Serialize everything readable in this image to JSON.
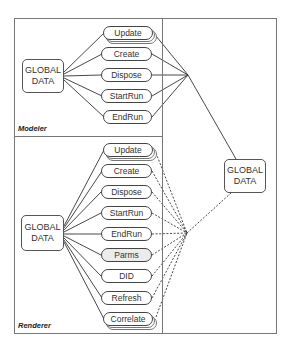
{
  "diagram": {
    "modeler": {
      "label": "Modeler",
      "global_box": "GLOBAL\nDATA",
      "methods": [
        "Update",
        "Create",
        "Dispose",
        "StartRun",
        "EndRun"
      ]
    },
    "renderer": {
      "label": "Renderer",
      "global_box": "GLOBAL\nDATA",
      "methods": [
        "Update",
        "Create",
        "Dispose",
        "StartRun",
        "EndRun",
        "Parms",
        "DID",
        "Refresh",
        "Correlate"
      ]
    },
    "shared": {
      "global_box": "GLOBAL\nDATA"
    },
    "colors": {
      "line": "#333333",
      "frame": "#777777",
      "parms_fill": "#ececec"
    }
  }
}
